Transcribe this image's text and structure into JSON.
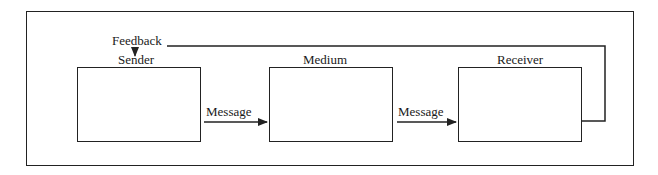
{
  "diagram": {
    "nodes": [
      {
        "id": "sender",
        "label": "Sender"
      },
      {
        "id": "medium",
        "label": "Medium"
      },
      {
        "id": "receiver",
        "label": "Receiver"
      }
    ],
    "edges": [
      {
        "from": "sender",
        "to": "medium",
        "label": "Message"
      },
      {
        "from": "medium",
        "to": "receiver",
        "label": "Message"
      },
      {
        "from": "receiver",
        "to": "sender",
        "label": "Feedback"
      }
    ],
    "colors": {
      "line": "#222222",
      "background": "#ffffff"
    }
  }
}
